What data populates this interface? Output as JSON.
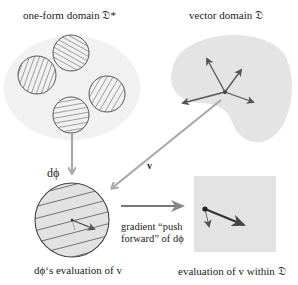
{
  "labels": {
    "oneform_domain": "one-form domain 𝔇*",
    "vector_domain": "vector domain 𝔇",
    "dphi": "dϕ",
    "v": "v",
    "gradient_line1": "gradient “push",
    "gradient_line2": "forward” of dϕ",
    "dphi_eval": "dϕ‘s evaluation of v",
    "eval_within": "evaluation of v within 𝔇"
  },
  "colors": {
    "domain_fill": "#e6e6e6",
    "arrow_gray": "#a9a9a9",
    "arrow_dark": "#555555",
    "circle_stroke": "#555555",
    "hatch": "#777777"
  }
}
